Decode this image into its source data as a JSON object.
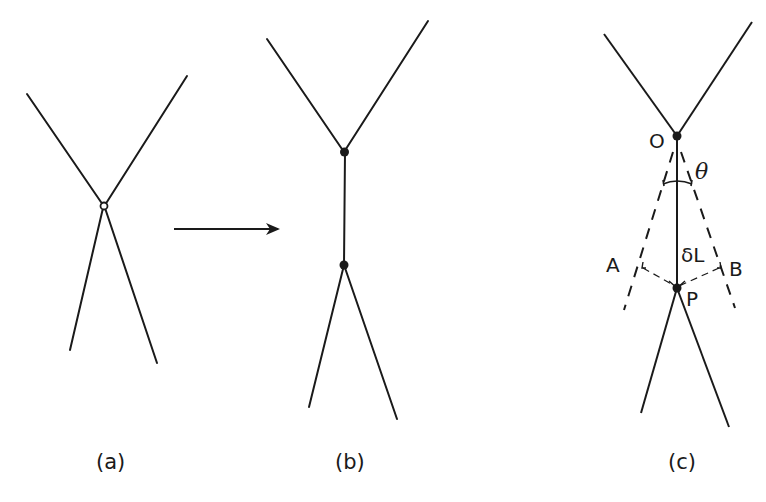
{
  "figure": {
    "panels": [
      {
        "id": "a",
        "label": "(a)",
        "description": "four lines meeting at a single vertex (open circle)"
      },
      {
        "id": "b",
        "label": "(b)",
        "description": "vertex split into two filled vertices joined by a vertical edge"
      },
      {
        "id": "c",
        "label": "(c)",
        "description": "geometry of the split with angle and length annotations"
      }
    ],
    "arrow": {
      "from": "a",
      "to": "b"
    },
    "panel_c_labels": {
      "O": "O",
      "P": "P",
      "A": "A",
      "B": "B",
      "theta": "θ",
      "delta_L": "δL"
    },
    "colors": {
      "line": "#1a1a1a",
      "background": "#ffffff"
    }
  }
}
